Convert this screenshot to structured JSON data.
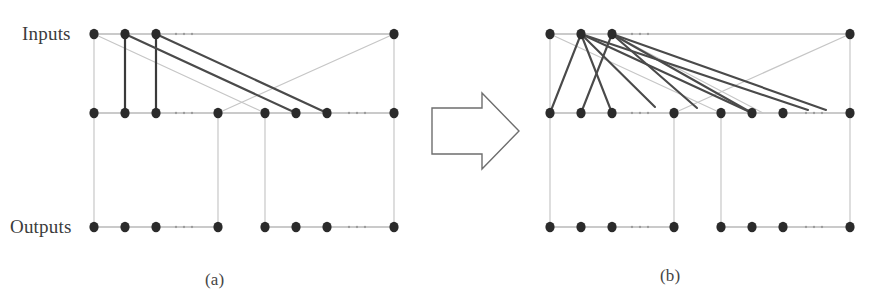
{
  "figure": {
    "domain": "diagram",
    "kind": "three-layer-network-transformation",
    "width": 875,
    "height": 306,
    "background_color": "#ffffff",
    "labels": {
      "inputs": "Inputs",
      "outputs": "Outputs",
      "caption_a": "(a)",
      "caption_b": "(b)"
    },
    "style": {
      "node_color": "#2b2b2b",
      "node_radius_x": 4.6,
      "node_radius_y": 5.2,
      "rail_color": "#b9b9b9",
      "rail_width": 1.3,
      "vertical_light_color": "#c2c2c2",
      "vertical_light_width": 1.1,
      "vertical_dark_color": "#3a3a3a",
      "vertical_dark_width": 2.2,
      "edge_dark_color": "#4a4a4a",
      "edge_dark_width": 2.1,
      "edge_light_color": "#c6c6c6",
      "edge_light_width": 1.2,
      "ellipsis_color": "#9a9a9a",
      "arrow_stroke": "#6e6e6e",
      "arrow_fill": "#ffffff",
      "arrow_width": 1.4,
      "label_color": "#3b3b3b"
    },
    "rows": {
      "inputs_y": 34,
      "middle_y": 113,
      "outputs_y": 227
    },
    "panel_a": {
      "name": "before",
      "caption": "(a)",
      "node_x": [
        94,
        125,
        156,
        218,
        265,
        296,
        327,
        394
      ],
      "input_nodes_x": [
        94,
        125,
        156,
        394
      ],
      "middle_nodes_x": [
        94,
        125,
        156,
        218,
        265,
        296,
        327,
        394
      ],
      "output_nodes_x": [
        94,
        125,
        156,
        218,
        265,
        296,
        327,
        394
      ],
      "rails": [
        {
          "name": "inputs-rail",
          "y": 34,
          "x1": 94,
          "x2": 394
        },
        {
          "name": "middle-rail",
          "y": 113,
          "x1": 94,
          "x2": 394
        },
        {
          "name": "outputs-rail-left",
          "y": 227,
          "x1": 94,
          "x2": 218
        },
        {
          "name": "outputs-rail-right",
          "y": 227,
          "x1": 265,
          "x2": 394
        }
      ],
      "ellipses": [
        {
          "name": "inputs-ellipsis",
          "x": 184,
          "y": 34
        },
        {
          "name": "middle-ellipsis-left",
          "x": 184,
          "y": 113
        },
        {
          "name": "middle-ellipsis-right",
          "x": 357,
          "y": 113
        },
        {
          "name": "outputs-ellipsis-left",
          "x": 184,
          "y": 227
        },
        {
          "name": "outputs-ellipsis-right",
          "x": 357,
          "y": 227
        }
      ],
      "vertical_light": [
        {
          "x": 94,
          "y1": 34,
          "y2": 113
        },
        {
          "x": 394,
          "y1": 34,
          "y2": 113
        },
        {
          "x": 94,
          "y1": 113,
          "y2": 227
        },
        {
          "x": 218,
          "y1": 113,
          "y2": 227
        },
        {
          "x": 265,
          "y1": 113,
          "y2": 227
        },
        {
          "x": 394,
          "y1": 113,
          "y2": 227
        }
      ],
      "vertical_dark": [
        {
          "x": 125,
          "y1": 34,
          "y2": 113
        },
        {
          "x": 156,
          "y1": 34,
          "y2": 113
        }
      ],
      "edges_dark": [
        {
          "from_x": 125,
          "from_y": 34,
          "to_x": 296,
          "to_y": 113
        },
        {
          "from_x": 156,
          "from_y": 34,
          "to_x": 327,
          "to_y": 113
        }
      ],
      "edges_light": [
        {
          "from_x": 94,
          "from_y": 34,
          "to_x": 265,
          "to_y": 113
        },
        {
          "from_x": 394,
          "from_y": 34,
          "to_x": 218,
          "to_y": 113
        }
      ]
    },
    "panel_b": {
      "name": "after",
      "caption": "(b)",
      "node_x": [
        550,
        581,
        612,
        674,
        721,
        752,
        783,
        850
      ],
      "input_nodes_x": [
        550,
        581,
        612,
        850
      ],
      "middle_nodes_x": [
        550,
        581,
        612,
        674,
        721,
        752,
        783,
        850
      ],
      "output_nodes_x": [
        550,
        581,
        612,
        674,
        721,
        752,
        783,
        850
      ],
      "rails": [
        {
          "name": "inputs-rail",
          "y": 34,
          "x1": 550,
          "x2": 850
        },
        {
          "name": "middle-rail",
          "y": 113,
          "x1": 550,
          "x2": 850
        },
        {
          "name": "outputs-rail-left",
          "y": 227,
          "x1": 550,
          "x2": 674
        },
        {
          "name": "outputs-rail-right",
          "y": 227,
          "x1": 721,
          "x2": 850
        }
      ],
      "ellipses": [
        {
          "name": "inputs-ellipsis",
          "x": 640,
          "y": 34
        },
        {
          "name": "middle-ellipsis-left",
          "x": 640,
          "y": 113
        },
        {
          "name": "middle-ellipsis-right",
          "x": 814,
          "y": 113
        },
        {
          "name": "outputs-ellipsis-left",
          "x": 640,
          "y": 227
        },
        {
          "name": "outputs-ellipsis-right",
          "x": 814,
          "y": 227
        }
      ],
      "vertical_light": [
        {
          "x": 550,
          "y1": 34,
          "y2": 113
        },
        {
          "x": 850,
          "y1": 34,
          "y2": 113
        },
        {
          "x": 550,
          "y1": 113,
          "y2": 227
        },
        {
          "x": 674,
          "y1": 113,
          "y2": 227
        },
        {
          "x": 721,
          "y1": 113,
          "y2": 227
        },
        {
          "x": 850,
          "y1": 113,
          "y2": 227
        }
      ],
      "vertical_dark": [],
      "edges_dark": [
        {
          "from_x": 581,
          "from_y": 34,
          "to_x": 550,
          "to_y": 113
        },
        {
          "from_x": 581,
          "from_y": 34,
          "to_x": 612,
          "to_y": 113
        },
        {
          "from_x": 581,
          "from_y": 34,
          "to_x": 655,
          "to_y": 107
        },
        {
          "from_x": 581,
          "from_y": 34,
          "to_x": 752,
          "to_y": 113
        },
        {
          "from_x": 581,
          "from_y": 34,
          "to_x": 808,
          "to_y": 110
        },
        {
          "from_x": 612,
          "from_y": 34,
          "to_x": 581,
          "to_y": 113
        },
        {
          "from_x": 612,
          "from_y": 34,
          "to_x": 697,
          "to_y": 108
        },
        {
          "from_x": 612,
          "from_y": 34,
          "to_x": 752,
          "to_y": 113
        },
        {
          "from_x": 612,
          "from_y": 34,
          "to_x": 826,
          "to_y": 110
        }
      ],
      "edges_light": [
        {
          "from_x": 550,
          "from_y": 34,
          "to_x": 721,
          "to_y": 113
        },
        {
          "from_x": 850,
          "from_y": 34,
          "to_x": 674,
          "to_y": 113
        },
        {
          "from_x": 612,
          "from_y": 34,
          "to_x": 763,
          "to_y": 113
        }
      ]
    },
    "arrow": {
      "name": "transformation-arrow",
      "points": "432,108 482,108 482,93 519,131 482,169 482,154 432,154"
    }
  }
}
